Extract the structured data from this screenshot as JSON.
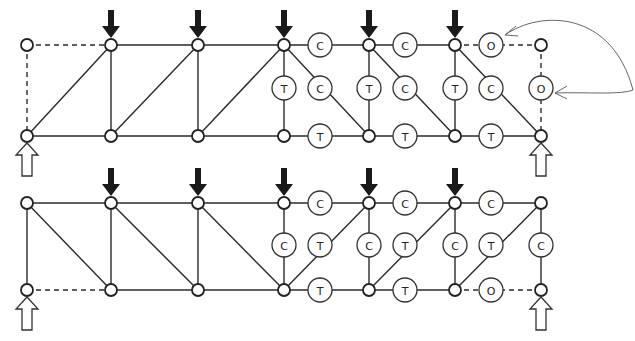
{
  "diagram": {
    "type": "truss force diagram",
    "legend_meaning": {
      "C": "compression",
      "T": "tension",
      "O": "zero-force member"
    },
    "trusses": [
      {
        "name": "upper-truss",
        "top_chord_y": 45,
        "bottom_chord_y": 136,
        "node_x": [
          27,
          111,
          198,
          284,
          369,
          455,
          541
        ],
        "loads_at_x": [
          111,
          198,
          284,
          369,
          455
        ],
        "supports_at_x": [
          27,
          541
        ],
        "members": [
          {
            "from": [
              27,
              45
            ],
            "to": [
              111,
              45
            ],
            "style": "dashed"
          },
          {
            "from": [
              27,
              45
            ],
            "to": [
              27,
              136
            ],
            "style": "dashed"
          },
          {
            "from": [
              111,
              45
            ],
            "to": [
              455,
              45
            ],
            "style": "solid"
          },
          {
            "from": [
              455,
              45
            ],
            "to": [
              541,
              45
            ],
            "style": "dashed"
          },
          {
            "from": [
              541,
              45
            ],
            "to": [
              541,
              136
            ],
            "style": "dashed"
          },
          {
            "from": [
              27,
              136
            ],
            "to": [
              541,
              136
            ],
            "style": "solid"
          },
          {
            "from": [
              111,
              45
            ],
            "to": [
              111,
              136
            ],
            "style": "solid"
          },
          {
            "from": [
              198,
              45
            ],
            "to": [
              198,
              136
            ],
            "style": "solid"
          },
          {
            "from": [
              284,
              45
            ],
            "to": [
              284,
              136
            ],
            "style": "solid"
          },
          {
            "from": [
              369,
              45
            ],
            "to": [
              369,
              136
            ],
            "style": "solid"
          },
          {
            "from": [
              455,
              45
            ],
            "to": [
              455,
              136
            ],
            "style": "solid"
          },
          {
            "from": [
              27,
              136
            ],
            "to": [
              111,
              45
            ],
            "style": "solid"
          },
          {
            "from": [
              111,
              136
            ],
            "to": [
              198,
              45
            ],
            "style": "solid"
          },
          {
            "from": [
              198,
              136
            ],
            "to": [
              284,
              45
            ],
            "style": "solid"
          },
          {
            "from": [
              284,
              45
            ],
            "to": [
              369,
              136
            ],
            "style": "solid"
          },
          {
            "from": [
              369,
              45
            ],
            "to": [
              455,
              136
            ],
            "style": "solid"
          },
          {
            "from": [
              455,
              45
            ],
            "to": [
              541,
              136
            ],
            "style": "solid"
          }
        ],
        "labels": [
          {
            "x": 320,
            "y": 45,
            "text": "C"
          },
          {
            "x": 405,
            "y": 45,
            "text": "C"
          },
          {
            "x": 491,
            "y": 45,
            "text": "O"
          },
          {
            "x": 284,
            "y": 88,
            "text": "T"
          },
          {
            "x": 320,
            "y": 88,
            "text": "C"
          },
          {
            "x": 369,
            "y": 88,
            "text": "T"
          },
          {
            "x": 405,
            "y": 88,
            "text": "C"
          },
          {
            "x": 455,
            "y": 88,
            "text": "T"
          },
          {
            "x": 491,
            "y": 88,
            "text": "C"
          },
          {
            "x": 541,
            "y": 88,
            "text": "O"
          },
          {
            "x": 320,
            "y": 136,
            "text": "T"
          },
          {
            "x": 405,
            "y": 136,
            "text": "T"
          },
          {
            "x": 491,
            "y": 136,
            "text": "T"
          }
        ]
      },
      {
        "name": "lower-truss",
        "top_chord_y": 203,
        "bottom_chord_y": 290,
        "node_x": [
          27,
          111,
          198,
          284,
          369,
          455,
          541
        ],
        "loads_at_x": [
          111,
          198,
          284,
          369,
          455
        ],
        "supports_at_x": [
          27,
          541
        ],
        "members": [
          {
            "from": [
              27,
              203
            ],
            "to": [
              541,
              203
            ],
            "style": "solid"
          },
          {
            "from": [
              27,
              290
            ],
            "to": [
              111,
              290
            ],
            "style": "dashed"
          },
          {
            "from": [
              111,
              290
            ],
            "to": [
              455,
              290
            ],
            "style": "solid"
          },
          {
            "from": [
              455,
              290
            ],
            "to": [
              541,
              290
            ],
            "style": "dashed"
          },
          {
            "from": [
              27,
              203
            ],
            "to": [
              27,
              290
            ],
            "style": "solid"
          },
          {
            "from": [
              111,
              203
            ],
            "to": [
              111,
              290
            ],
            "style": "solid"
          },
          {
            "from": [
              198,
              203
            ],
            "to": [
              198,
              290
            ],
            "style": "solid"
          },
          {
            "from": [
              284,
              203
            ],
            "to": [
              284,
              290
            ],
            "style": "solid"
          },
          {
            "from": [
              369,
              203
            ],
            "to": [
              369,
              290
            ],
            "style": "solid"
          },
          {
            "from": [
              455,
              203
            ],
            "to": [
              455,
              290
            ],
            "style": "solid"
          },
          {
            "from": [
              541,
              203
            ],
            "to": [
              541,
              290
            ],
            "style": "solid"
          },
          {
            "from": [
              27,
              203
            ],
            "to": [
              111,
              290
            ],
            "style": "solid"
          },
          {
            "from": [
              111,
              203
            ],
            "to": [
              198,
              290
            ],
            "style": "solid"
          },
          {
            "from": [
              198,
              203
            ],
            "to": [
              284,
              290
            ],
            "style": "solid"
          },
          {
            "from": [
              284,
              290
            ],
            "to": [
              369,
              203
            ],
            "style": "solid"
          },
          {
            "from": [
              369,
              290
            ],
            "to": [
              455,
              203
            ],
            "style": "solid"
          },
          {
            "from": [
              455,
              290
            ],
            "to": [
              541,
              203
            ],
            "style": "solid"
          }
        ],
        "labels": [
          {
            "x": 320,
            "y": 203,
            "text": "C"
          },
          {
            "x": 405,
            "y": 203,
            "text": "C"
          },
          {
            "x": 491,
            "y": 203,
            "text": "C"
          },
          {
            "x": 284,
            "y": 245,
            "text": "C"
          },
          {
            "x": 320,
            "y": 245,
            "text": "T"
          },
          {
            "x": 369,
            "y": 245,
            "text": "C"
          },
          {
            "x": 405,
            "y": 245,
            "text": "T"
          },
          {
            "x": 455,
            "y": 245,
            "text": "C"
          },
          {
            "x": 491,
            "y": 245,
            "text": "T"
          },
          {
            "x": 541,
            "y": 245,
            "text": "C"
          },
          {
            "x": 320,
            "y": 290,
            "text": "T"
          },
          {
            "x": 405,
            "y": 290,
            "text": "T"
          },
          {
            "x": 491,
            "y": 290,
            "text": "O"
          }
        ]
      }
    ],
    "annotation_arrows": [
      {
        "path": "M 633 90 C 612 10, 540 10, 505 35",
        "target": "upper-top-chord-zero-member"
      },
      {
        "path": "M 633 90 C 620 95, 590 92, 555 93",
        "target": "upper-end-vertical-zero-member"
      }
    ]
  }
}
